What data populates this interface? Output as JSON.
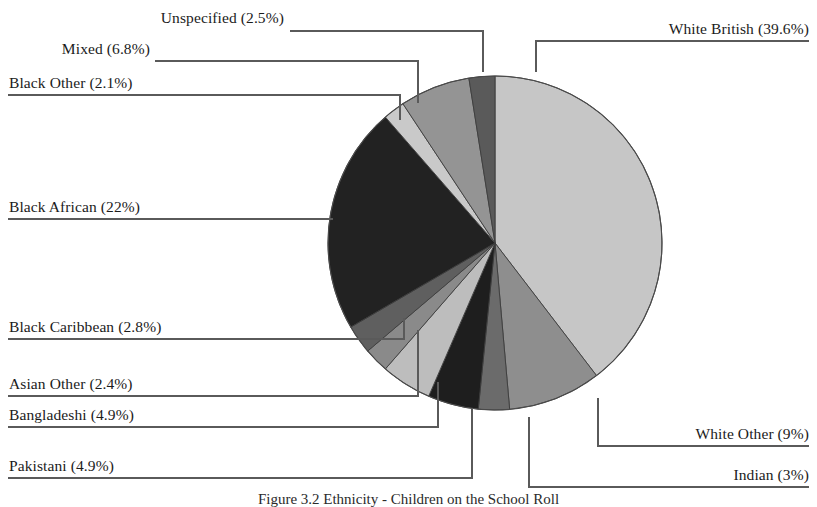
{
  "figure": {
    "caption": "Figure 3.2  Ethnicity - Children on the School Roll",
    "background": "#ffffff"
  },
  "chart_data": {
    "type": "pie",
    "title": "",
    "start_angle_deg": 0,
    "direction": "clockwise",
    "legend": "leader-line labels",
    "grid": false,
    "categories": [
      "White British",
      "White Other",
      "Indian",
      "Pakistani",
      "Bangladeshi",
      "Asian Other",
      "Black Caribbean",
      "Black African",
      "Black Other",
      "Mixed",
      "Unspecified"
    ],
    "values": [
      39.6,
      9,
      3,
      4.9,
      4.9,
      2.4,
      2.8,
      22,
      2.1,
      6.8,
      2.5
    ],
    "unit": "%",
    "colors": [
      "#c6c6c6",
      "#8e8e8e",
      "#6b6b6b",
      "#1e1e1e",
      "#bdbdbd",
      "#8a8a8a",
      "#5f5f5f",
      "#222222",
      "#c9c9c9",
      "#949494",
      "#5a5a5a"
    ],
    "slices": [
      {
        "label": "White British (39.6%)",
        "name": "White British",
        "value": 39.6,
        "color": "#c6c6c6"
      },
      {
        "label": "White Other (9%)",
        "name": "White Other",
        "value": 9,
        "color": "#8e8e8e"
      },
      {
        "label": "Indian (3%)",
        "name": "Indian",
        "value": 3,
        "color": "#6b6b6b"
      },
      {
        "label": "Pakistani (4.9%)",
        "name": "Pakistani",
        "value": 4.9,
        "color": "#1e1e1e"
      },
      {
        "label": "Bangladeshi (4.9%)",
        "name": "Bangladeshi",
        "value": 4.9,
        "color": "#bdbdbd"
      },
      {
        "label": "Asian Other (2.4%)",
        "name": "Asian Other",
        "value": 2.4,
        "color": "#8a8a8a"
      },
      {
        "label": "Black Caribbean (2.8%)",
        "name": "Black Caribbean",
        "value": 2.8,
        "color": "#5f5f5f"
      },
      {
        "label": "Black African (22%)",
        "name": "Black African",
        "value": 22,
        "color": "#222222"
      },
      {
        "label": "Black Other (2.1%)",
        "name": "Black Other",
        "value": 2.1,
        "color": "#c9c9c9"
      },
      {
        "label": "Mixed  (6.8%)",
        "name": "Mixed",
        "value": 6.8,
        "color": "#949494"
      },
      {
        "label": "Unspecified (2.5%)",
        "name": "Unspecified",
        "value": 2.5,
        "color": "#5a5a5a"
      }
    ]
  },
  "labels": {
    "unspecified": "Unspecified (2.5%)",
    "mixed": "Mixed  (6.8%)",
    "black_other": "Black Other (2.1%)",
    "black_african": "Black African (22%)",
    "black_caribbean": "Black Caribbean (2.8%)",
    "asian_other": "Asian Other (2.4%)",
    "bangladeshi": "Bangladeshi (4.9%)",
    "pakistani": "Pakistani (4.9%)",
    "white_british": "White British (39.6%)",
    "white_other": "White Other (9%)",
    "indian": "Indian (3%)"
  }
}
